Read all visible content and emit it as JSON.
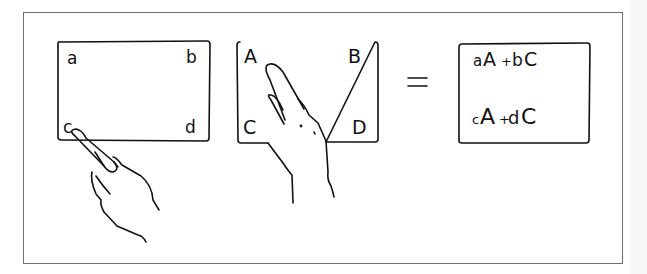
{
  "diagram": {
    "panel_left": {
      "labels": {
        "top_left": "a",
        "top_right": "b",
        "bottom_left": "c",
        "bottom_right": "d"
      },
      "pointer": "hand-pointing-at-c"
    },
    "panel_middle": {
      "labels": {
        "top_left": "A",
        "top_right": "B",
        "bottom_left": "C",
        "bottom_right": "D"
      },
      "pointer": "hand-pointing-at-A"
    },
    "equals": "=",
    "panel_result": {
      "row1": {
        "p1": "a",
        "t1": "A",
        "plus": "+",
        "p2": "b",
        "t2": "C"
      },
      "row2": {
        "p1": "c",
        "t1": "A",
        "plus": "+",
        "p2": "d",
        "t2": "C"
      }
    },
    "colors": {
      "ink": "#111111",
      "frame": "#6e6e6e",
      "background": "#ffffff"
    }
  }
}
